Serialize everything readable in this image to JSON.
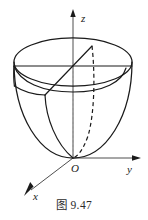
{
  "figure": {
    "caption": "图 9.47",
    "axes": {
      "z_label": "z",
      "y_label": "y",
      "x_label": "x",
      "origin_label": "O"
    },
    "colors": {
      "stroke": "#1a1a1a",
      "axis": "#3a3a3a",
      "dotted_axis": "#9a9a9a",
      "background": "#ffffff"
    },
    "geometry": {
      "type": "paraboloid-solid-with-cutting-plane",
      "origin": {
        "x": 73,
        "y": 158
      },
      "top_ellipse": {
        "cx": 73,
        "cy": 62,
        "rx": 59,
        "ry": 24
      },
      "mid_ellipse": {
        "cx": 73,
        "cy": 88,
        "rx": 50,
        "ry": 21
      },
      "bowl_depth": 96,
      "z_axis_top": {
        "x": 73,
        "y": 10
      },
      "y_axis_end": {
        "x": 141,
        "y": 158
      },
      "x_axis_end": {
        "x": 24,
        "y": 196
      }
    }
  }
}
